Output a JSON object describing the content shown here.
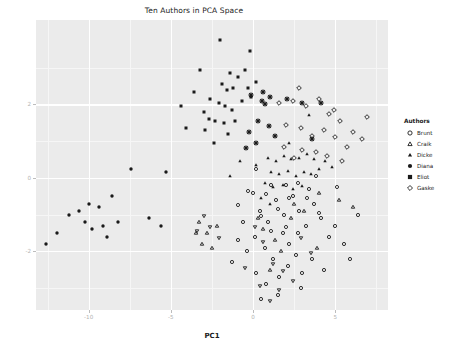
{
  "chart": {
    "title": "Ten Authors in PCA Space",
    "xlabel": "PC1",
    "ylabel": "PC2"
  },
  "legend": {
    "title": "Authors",
    "items": [
      {
        "label": "Brunt",
        "shape": "circle-open"
      },
      {
        "label": "Craik",
        "shape": "triangle-open"
      },
      {
        "label": "Dicke",
        "shape": "triangle-filled"
      },
      {
        "label": "Diana",
        "shape": "circle-filled"
      },
      {
        "label": "Eliot",
        "shape": "square-filled"
      },
      {
        "label": "Gaske",
        "shape": "diamond-open"
      }
    ]
  },
  "chart_data": {
    "type": "scatter",
    "title": "Ten Authors in PCA Space",
    "xlabel": "PC1",
    "ylabel": "PC2",
    "xlim": [
      -13.2,
      8.2
    ],
    "ylim": [
      -3.6,
      4.3
    ],
    "xticks": [
      -10,
      -5,
      0,
      5
    ],
    "yticks": [
      2,
      0,
      -2
    ],
    "grid": true,
    "legend_position": "right",
    "series": [
      {
        "name": "Brunt",
        "shape": "circle-open",
        "points": [
          [
            0.4,
            -0.9
          ],
          [
            0.9,
            -1.2
          ],
          [
            1.4,
            -0.6
          ],
          [
            1.9,
            -1.0
          ],
          [
            2.4,
            -0.5
          ],
          [
            0.1,
            -1.6
          ],
          [
            0.7,
            -1.9
          ],
          [
            1.2,
            -2.2
          ],
          [
            1.8,
            -1.5
          ],
          [
            2.2,
            -1.8
          ],
          [
            2.8,
            -0.9
          ],
          [
            3.2,
            -1.3
          ],
          [
            3.7,
            -0.7
          ],
          [
            4.1,
            -1.1
          ],
          [
            4.6,
            -1.6
          ],
          [
            -0.4,
            -2.0
          ],
          [
            -0.9,
            -1.7
          ],
          [
            -1.3,
            -2.3
          ],
          [
            0.2,
            -2.6
          ],
          [
            0.8,
            -2.9
          ],
          [
            1.6,
            -2.7
          ],
          [
            2.1,
            -2.4
          ],
          [
            2.6,
            -2.1
          ],
          [
            3.0,
            -2.6
          ],
          [
            3.6,
            -2.2
          ],
          [
            5.0,
            -1.3
          ],
          [
            5.5,
            -1.8
          ],
          [
            5.9,
            -2.2
          ],
          [
            6.4,
            -1.0
          ],
          [
            4.3,
            -2.5
          ],
          [
            1.1,
            -0.2
          ],
          [
            2.0,
            -0.2
          ],
          [
            3.4,
            -0.3
          ],
          [
            0.0,
            -0.4
          ],
          [
            2.7,
            -1.5
          ],
          [
            -0.6,
            -1.2
          ],
          [
            1.5,
            -3.2
          ],
          [
            2.9,
            -3.0
          ],
          [
            0.5,
            -3.3
          ]
        ]
      },
      {
        "name": "Craik",
        "shape": "triangle-open",
        "points": [
          [
            -3.3,
            -1.2
          ],
          [
            -2.8,
            -1.5
          ],
          [
            -3.1,
            -1.8
          ],
          [
            -2.5,
            -1.9
          ],
          [
            -3.5,
            -1.5
          ],
          [
            0.6,
            -1.4
          ],
          [
            1.3,
            -1.7
          ],
          [
            2.3,
            -1.1
          ],
          [
            3.1,
            -0.9
          ],
          [
            5.2,
            -0.6
          ],
          [
            6.1,
            -0.8
          ],
          [
            1.0,
            -2.5
          ],
          [
            0.3,
            -1.1
          ],
          [
            2.5,
            -0.7
          ],
          [
            4.0,
            -0.4
          ],
          [
            -2.2,
            -1.3
          ],
          [
            3.9,
            -1.9
          ],
          [
            1.7,
            -2.0
          ]
        ]
      },
      {
        "name": "Dicke",
        "shape": "triangle-filled",
        "points": [
          [
            0.9,
            0.55
          ],
          [
            1.4,
            0.45
          ],
          [
            1.9,
            0.6
          ],
          [
            2.3,
            0.5
          ],
          [
            2.8,
            0.55
          ],
          [
            3.3,
            0.65
          ],
          [
            3.7,
            0.5
          ],
          [
            1.1,
            0.15
          ],
          [
            1.6,
            0.1
          ],
          [
            2.1,
            0.2
          ],
          [
            2.6,
            0.05
          ],
          [
            3.1,
            0.15
          ],
          [
            3.5,
            0.1
          ],
          [
            4.0,
            0.25
          ],
          [
            4.4,
            0.45
          ],
          [
            0.7,
            -0.15
          ],
          [
            1.2,
            -0.25
          ],
          [
            1.8,
            -0.2
          ],
          [
            2.4,
            -0.3
          ],
          [
            3.0,
            -0.22
          ],
          [
            0.5,
            -0.55
          ],
          [
            1.0,
            -0.7
          ],
          [
            -1.4,
            0.05
          ],
          [
            -0.8,
            0.45
          ],
          [
            4.8,
            0.3
          ],
          [
            3.4,
            1.7
          ],
          [
            2.2,
            0.95
          ],
          [
            0.2,
            0.35
          ]
        ]
      },
      {
        "name": "Diana",
        "shape": "circle-filled",
        "points": [
          [
            -11.9,
            -1.5
          ],
          [
            -11.2,
            -1.0
          ],
          [
            -10.6,
            -0.9
          ],
          [
            -10.2,
            -1.2
          ],
          [
            -10.0,
            -0.7
          ],
          [
            -9.8,
            -1.4
          ],
          [
            -9.4,
            -0.8
          ],
          [
            -9.1,
            -1.3
          ],
          [
            -8.6,
            -0.5
          ],
          [
            -8.9,
            -1.6
          ],
          [
            -8.2,
            -1.2
          ],
          [
            -6.3,
            -1.1
          ],
          [
            -5.6,
            -1.3
          ],
          [
            -5.3,
            0.15
          ],
          [
            -12.6,
            -1.8
          ],
          [
            -7.4,
            0.25
          ]
        ]
      },
      {
        "name": "Eliot",
        "shape": "square-filled",
        "points": [
          [
            -2.0,
            3.75
          ],
          [
            -3.2,
            2.95
          ],
          [
            -1.4,
            2.85
          ],
          [
            -0.9,
            2.75
          ],
          [
            -0.5,
            2.95
          ],
          [
            -1.9,
            2.55
          ],
          [
            -1.6,
            2.4
          ],
          [
            -1.2,
            2.45
          ],
          [
            -0.3,
            2.45
          ],
          [
            -2.6,
            2.15
          ],
          [
            -2.1,
            2.05
          ],
          [
            -1.7,
            1.95
          ],
          [
            -1.3,
            1.85
          ],
          [
            -0.7,
            2.1
          ],
          [
            -3.0,
            1.8
          ],
          [
            -2.7,
            1.6
          ],
          [
            -2.3,
            1.55
          ],
          [
            -1.8,
            1.5
          ],
          [
            -1.1,
            1.55
          ],
          [
            -2.9,
            1.3
          ],
          [
            -1.5,
            1.2
          ],
          [
            -4.1,
            1.35
          ],
          [
            -4.4,
            1.95
          ],
          [
            -2.4,
            0.95
          ],
          [
            -0.2,
            3.45
          ],
          [
            -0.1,
            2.2
          ],
          [
            0.2,
            2.6
          ],
          [
            -3.6,
            2.35
          ]
        ]
      },
      {
        "name": "Gaske",
        "shape": "diamond-open",
        "points": [
          [
            1.6,
            2.05
          ],
          [
            2.4,
            2.1
          ],
          [
            3.2,
            1.95
          ],
          [
            4.0,
            2.15
          ],
          [
            4.6,
            1.75
          ],
          [
            5.3,
            1.55
          ],
          [
            6.1,
            1.25
          ],
          [
            6.6,
            1.05
          ],
          [
            2.0,
            1.45
          ],
          [
            2.9,
            1.35
          ],
          [
            3.6,
            1.15
          ],
          [
            4.3,
            1.3
          ],
          [
            5.0,
            1.1
          ],
          [
            5.7,
            0.85
          ],
          [
            3.0,
            0.75
          ],
          [
            3.8,
            0.7
          ],
          [
            4.5,
            0.6
          ],
          [
            2.5,
            0.55
          ],
          [
            5.4,
            0.45
          ],
          [
            1.9,
            0.85
          ],
          [
            4.9,
            1.85
          ],
          [
            6.9,
            1.65
          ],
          [
            2.8,
            2.45
          ]
        ]
      },
      {
        "name": "Author7",
        "shape": "asterisk",
        "points": [
          [
            0.55,
            2.1
          ],
          [
            0.75,
            2.0
          ],
          [
            1.05,
            2.2
          ],
          [
            0.3,
            1.55
          ],
          [
            0.95,
            1.4
          ],
          [
            -0.25,
            1.25
          ],
          [
            -0.45,
            0.8
          ],
          [
            0.15,
            0.95
          ],
          [
            2.05,
            2.15
          ],
          [
            2.95,
            2.05
          ],
          [
            4.15,
            2.05
          ],
          [
            3.55,
            1.05
          ],
          [
            0.6,
            2.35
          ],
          [
            -0.1,
            2.25
          ],
          [
            1.35,
            1.15
          ]
        ]
      },
      {
        "name": "Author8",
        "shape": "triangle-down-open",
        "points": [
          [
            -3.0,
            -1.05
          ],
          [
            -2.6,
            -1.35
          ],
          [
            -3.4,
            -1.45
          ],
          [
            0.1,
            -1.35
          ],
          [
            0.6,
            -1.75
          ],
          [
            1.2,
            -2.35
          ],
          [
            1.8,
            -2.55
          ],
          [
            2.4,
            -2.8
          ],
          [
            1.0,
            -3.35
          ],
          [
            0.4,
            -2.95
          ],
          [
            -0.5,
            -2.45
          ],
          [
            2.9,
            -1.65
          ],
          [
            3.5,
            -2.05
          ],
          [
            -2.1,
            -1.65
          ],
          [
            1.55,
            -3.05
          ]
        ]
      },
      {
        "name": "Author9",
        "shape": "hexagon-open",
        "points": [
          [
            0.2,
            0.25
          ],
          [
            0.8,
            -0.45
          ],
          [
            1.5,
            -0.85
          ],
          [
            2.2,
            -0.55
          ],
          [
            2.7,
            -0.15
          ],
          [
            3.3,
            -0.55
          ],
          [
            4.0,
            -0.95
          ],
          [
            -0.3,
            -0.35
          ],
          [
            -0.9,
            -0.75
          ],
          [
            1.1,
            -1.45
          ],
          [
            2.0,
            -1.35
          ],
          [
            3.8,
            0.05
          ],
          [
            5.1,
            -0.25
          ],
          [
            0.45,
            -1.05
          ]
        ]
      },
      {
        "name": "Author10",
        "shape": "circle-small",
        "points": [
          [
            -5.9,
            -0.55
          ],
          [
            -5.2,
            -0.75
          ],
          [
            -6.5,
            -0.95
          ],
          [
            -4.6,
            -1.15
          ]
        ]
      }
    ]
  }
}
